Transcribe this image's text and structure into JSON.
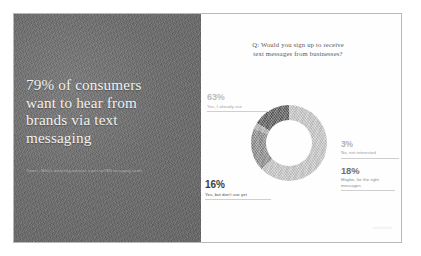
{
  "slide": {
    "left_panel": {
      "headline_lines": [
        "79% of consumers",
        "want to hear from",
        "brands via text",
        "messaging"
      ],
      "source": "Source: Mobile marketing statistics report on SMS messaging trends"
    },
    "right_panel": {
      "title_lines": [
        "Q: Would you sign up to receive",
        "text messages from businesses?"
      ],
      "watermark": "attentive"
    }
  },
  "chart_data": {
    "type": "pie",
    "title": "Q: Would you sign up to receive text messages from businesses?",
    "subtype": "donut",
    "hole_ratio": 0.6,
    "legend_position": "callout-labels",
    "categories": [
      "Yes, I already use",
      "Maybe, for the right messages",
      "No, not interested",
      "Yes, but don't use yet"
    ],
    "values": [
      63,
      18,
      3,
      16
    ],
    "labels": [
      {
        "pct": "63%",
        "desc": "Yes, I already use",
        "color": "#c8c8c8"
      },
      {
        "pct": "18%",
        "desc_line1": "Maybe, for the right",
        "desc_line2": "messages",
        "color": "#8d8d8d"
      },
      {
        "pct": "3%",
        "desc": "No, not interested",
        "color": "#b5b5b5"
      },
      {
        "pct": "16%",
        "desc": "Yes, but don't use yet",
        "color": "#5c5c5c"
      }
    ],
    "units": "percent",
    "total": 100
  },
  "colors": {
    "panel_background": "#6e6e6e",
    "headline_text": "#f2f1ee",
    "chart_background": "#fefefe",
    "title_text": "#57585a",
    "slice_63": "#c8c8c8",
    "slice_18": "#8d8d8d",
    "slice_3": "#b5b5b5",
    "slice_16": "#5c5c5c"
  }
}
